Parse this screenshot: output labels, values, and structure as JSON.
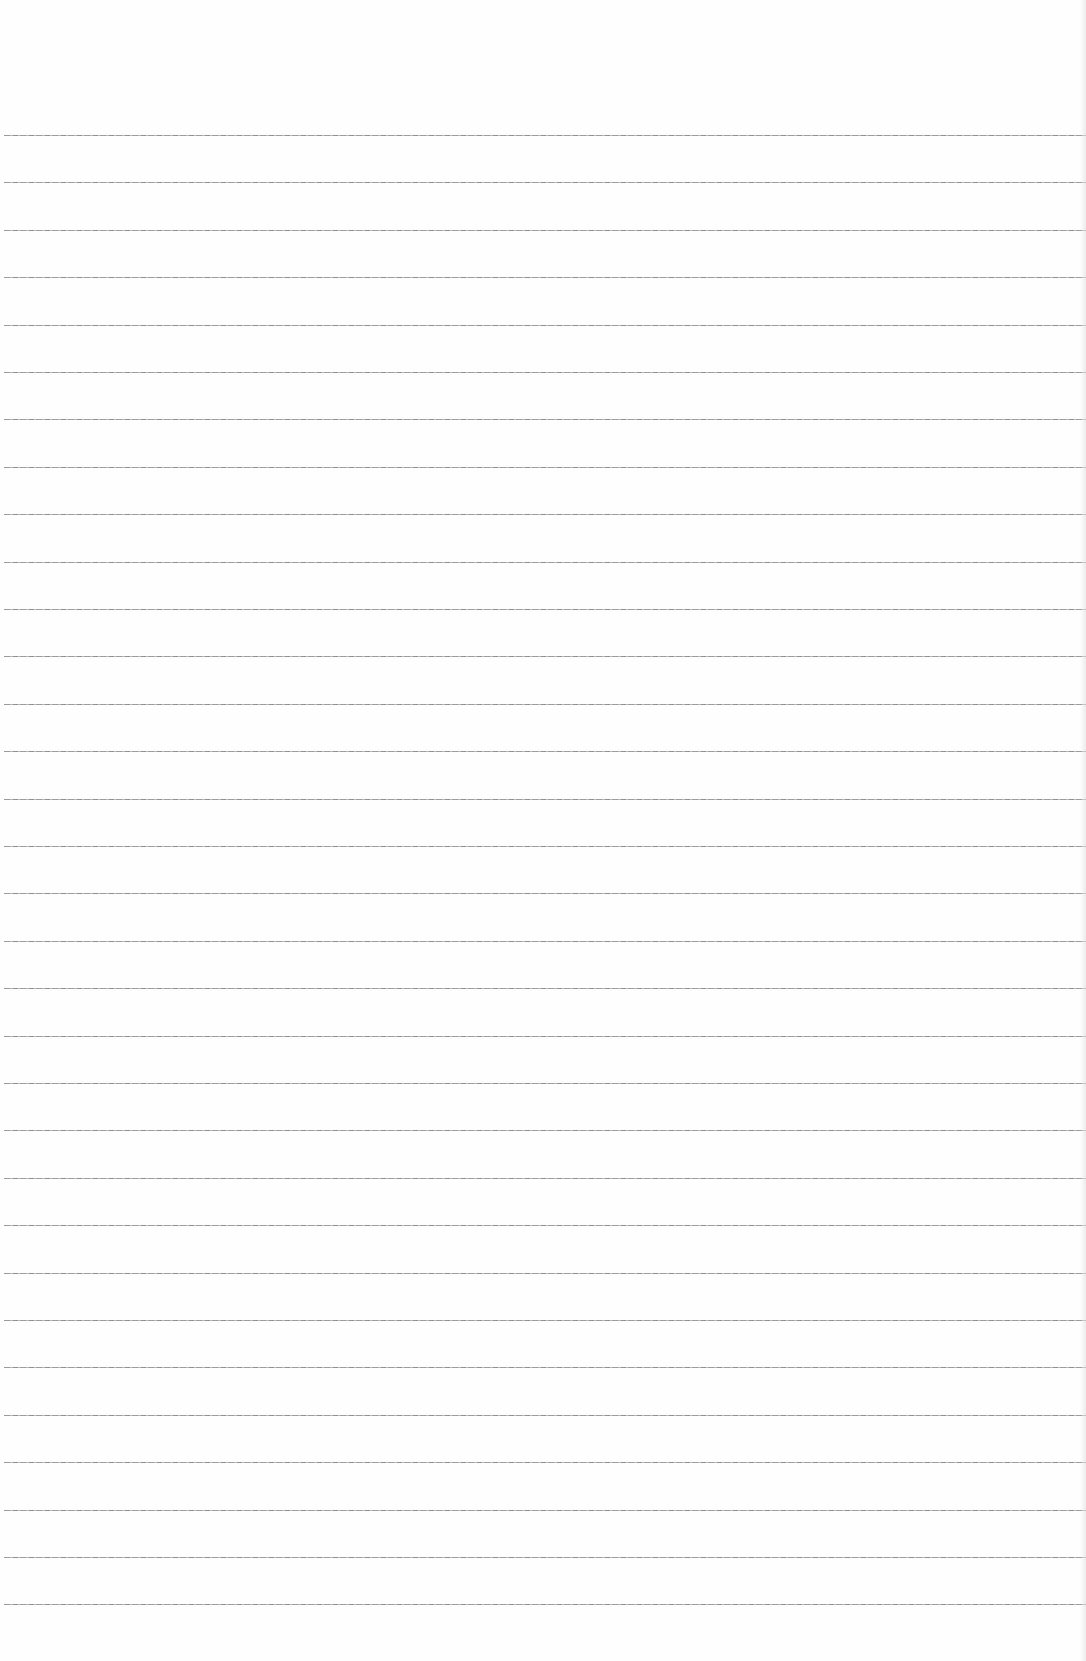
{
  "page": {
    "type": "lined-paper",
    "background_color": "#fefefe",
    "line_color": "#8a8a8a",
    "first_line_y": 135,
    "line_spacing": 47.4,
    "line_count": 32,
    "text": ""
  }
}
